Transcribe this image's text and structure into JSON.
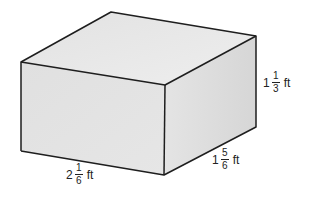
{
  "figure": {
    "shape": "rectangular-prism",
    "colors": {
      "top_face": "#e9e9e9",
      "front_face": "#e2e2e2",
      "side_face": "#dcdcdc",
      "edge": "#1e1e1e",
      "label_text": "#222222"
    },
    "dimensions": {
      "length": {
        "whole": "2",
        "numerator": "1",
        "denominator": "6",
        "unit": "ft"
      },
      "width": {
        "whole": "1",
        "numerator": "5",
        "denominator": "6",
        "unit": "ft"
      },
      "height": {
        "whole": "1",
        "numerator": "1",
        "denominator": "3",
        "unit": "ft"
      }
    }
  }
}
